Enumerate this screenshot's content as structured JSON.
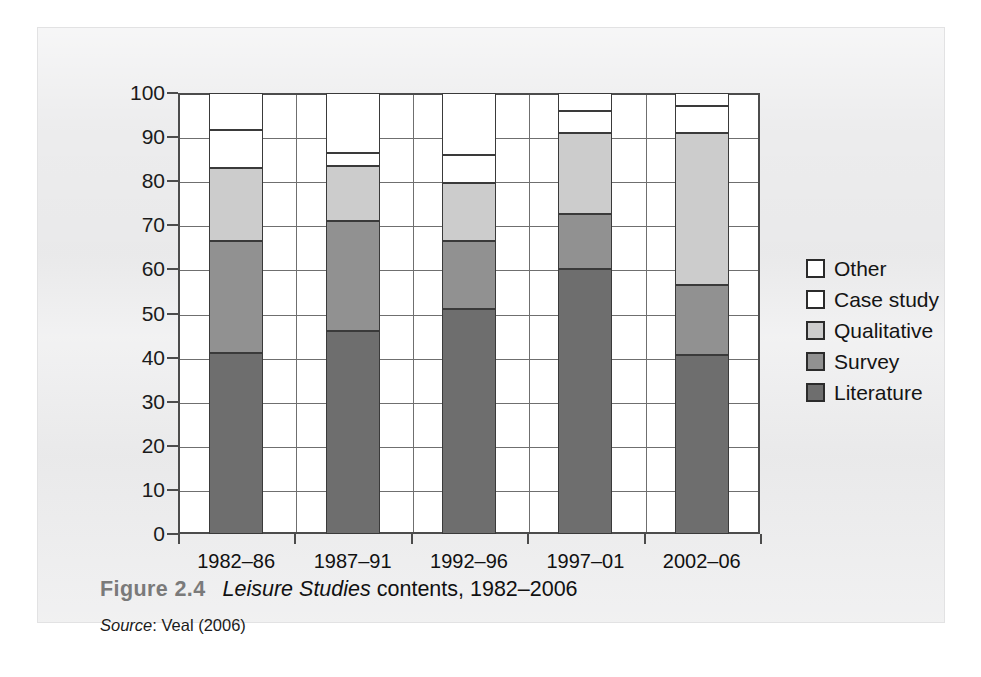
{
  "figure": {
    "caption_prefix": "Figure 2.4",
    "caption_italic": "Leisure Studies",
    "caption_rest": " contents, 1982–2006",
    "source_label": "Source",
    "source_text": ": Veal (2006)"
  },
  "legend": {
    "items": [
      {
        "label": "Other",
        "color": "#ffffff"
      },
      {
        "label": "Case study",
        "color": "#ffffff"
      },
      {
        "label": "Qualitative",
        "color": "#cccccc"
      },
      {
        "label": "Survey",
        "color": "#919191"
      },
      {
        "label": "Literature",
        "color": "#6e6e6e"
      }
    ]
  },
  "axes": {
    "y_ticks": [
      "0",
      "10",
      "20",
      "30",
      "40",
      "50",
      "60",
      "70",
      "80",
      "90",
      "100"
    ],
    "y_min": 0,
    "y_max": 100,
    "x_ticks": [
      "1982–86",
      "1987–91",
      "1992–96",
      "1997–01",
      "2002–06"
    ]
  },
  "chart_data": {
    "type": "bar",
    "stacked": true,
    "title": "Leisure Studies contents, 1982–2006",
    "xlabel": "",
    "ylabel": "",
    "ylim": [
      0,
      100
    ],
    "grid": true,
    "legend_position": "right",
    "categories": [
      "1982–86",
      "1987–91",
      "1992–96",
      "1997–01",
      "2002–06"
    ],
    "series": [
      {
        "name": "Literature",
        "color": "#6e6e6e",
        "values": [
          41.0,
          46.0,
          51.0,
          60.0,
          40.5
        ]
      },
      {
        "name": "Survey",
        "color": "#919191",
        "values": [
          25.5,
          25.0,
          15.5,
          12.5,
          16.0
        ]
      },
      {
        "name": "Qualitative",
        "color": "#cccccc",
        "values": [
          16.5,
          12.5,
          13.0,
          18.5,
          34.5
        ]
      },
      {
        "name": "Case study",
        "color": "#ffffff",
        "values": [
          8.5,
          3.0,
          6.5,
          5.0,
          6.0
        ]
      },
      {
        "name": "Other",
        "color": "#ffffff",
        "values": [
          8.5,
          13.5,
          14.0,
          4.0,
          3.0
        ]
      }
    ],
    "cumulative_tops": [
      [
        41.0,
        66.5,
        83.0,
        91.5,
        100
      ],
      [
        46.0,
        71.0,
        83.5,
        86.5,
        100
      ],
      [
        51.0,
        66.5,
        79.5,
        86.0,
        100
      ],
      [
        60.0,
        72.5,
        91.0,
        96.0,
        100
      ],
      [
        40.5,
        56.5,
        91.0,
        97.0,
        100
      ]
    ]
  }
}
